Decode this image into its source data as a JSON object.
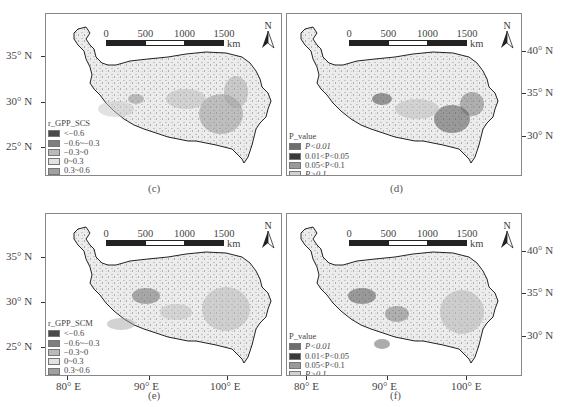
{
  "figure": {
    "panels": [
      {
        "id": "c",
        "caption": "(c)",
        "legend": {
          "title": "r_GPP_SCS",
          "items": [
            {
              "label": "<−0.6",
              "color": "#4a4a4a"
            },
            {
              "label": "−0.6~−0.3",
              "color": "#7e7e7e"
            },
            {
              "label": "−0.3~0",
              "color": "#b9b9b9"
            },
            {
              "label": "0~0.3",
              "color": "#e2e2e2"
            },
            {
              "label": "0.3~0.6",
              "color": "#a0a0a0"
            },
            {
              "label": ">0.6",
              "color": "#6a6a6a"
            }
          ]
        }
      },
      {
        "id": "d",
        "caption": "(d)",
        "legend": {
          "title": "P_value",
          "items": [
            {
              "label": "P<0.01",
              "color": "#6e6e6e"
            },
            {
              "label": "0.01<P<0.05",
              "color": "#3a3a3a"
            },
            {
              "label": "0.05<P<0.1",
              "color": "#9a9a9a"
            },
            {
              "label": "P>0.1",
              "color": "#d2d2d2"
            }
          ]
        }
      },
      {
        "id": "e",
        "caption": "(e)",
        "legend": {
          "title": "r_GPP_SCM",
          "items": [
            {
              "label": "<−0.6",
              "color": "#4a4a4a"
            },
            {
              "label": "−0.6~−0.3",
              "color": "#7e7e7e"
            },
            {
              "label": "−0.3~0",
              "color": "#b9b9b9"
            },
            {
              "label": "0~0.3",
              "color": "#e2e2e2"
            },
            {
              "label": "0.3~0.6",
              "color": "#a0a0a0"
            },
            {
              "label": ">0.6",
              "color": "#6a6a6a"
            }
          ]
        }
      },
      {
        "id": "f",
        "caption": "(f)",
        "legend": {
          "title": "P_value",
          "items": [
            {
              "label": "P<0.01",
              "color": "#6e6e6e"
            },
            {
              "label": "0.01<P<0.05",
              "color": "#3a3a3a"
            },
            {
              "label": "0.05<P<0.1",
              "color": "#9a9a9a"
            },
            {
              "label": "P>0.1",
              "color": "#d2d2d2"
            }
          ]
        }
      }
    ],
    "scalebar": {
      "ticks": [
        "0",
        "500",
        "1000",
        "1500"
      ],
      "unit": "km"
    },
    "north_arrow": {
      "label": "N"
    },
    "left_axis": [
      "35° N",
      "30° N",
      "25° N"
    ],
    "right_axis": [
      "40° N",
      "35° N",
      "30° N"
    ],
    "bottom_axis": [
      "80° E",
      "90° E",
      "100° E"
    ]
  }
}
